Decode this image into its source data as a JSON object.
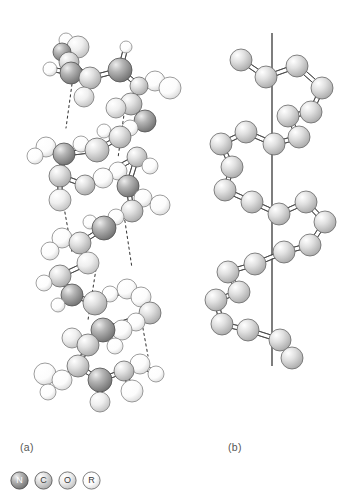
{
  "figure": {
    "type": "molecular-structure-diagram",
    "background": "#ffffff",
    "panels": [
      {
        "id": "a",
        "label": "(a)",
        "description": "ball-and-stick alpha-helix with hydrogen bonds"
      },
      {
        "id": "b",
        "label": "(b)",
        "description": "simplified backbone helix with vertical helix axis"
      }
    ]
  },
  "legend": {
    "items": [
      {
        "symbol": "N",
        "name": "nitrogen",
        "fill": "#8e8e8e",
        "stroke": "#4a4a4a",
        "label_color": "light"
      },
      {
        "symbol": "C",
        "name": "carbon",
        "fill": "#d2d2d2",
        "stroke": "#5a5a5a",
        "label_color": "dark"
      },
      {
        "symbol": "O",
        "name": "oxygen",
        "fill": "#e8e8e8",
        "stroke": "#6a6a6a",
        "label_color": "dark"
      },
      {
        "symbol": "R",
        "name": "side-chain",
        "fill": "#fbfbfb",
        "stroke": "#707070",
        "label_color": "dark"
      }
    ]
  },
  "colors": {
    "nitrogen": "#8e8e8e",
    "carbon": "#d2d2d2",
    "oxygen": "#e8e8e8",
    "hydrogen": "#fdfdfd",
    "bond_stroke": "#4a4a4a",
    "hbond_stroke": "#3a3a3a",
    "axis_stroke": "#1f1f1f",
    "text": "#555555"
  },
  "chart_data": {
    "type": "scatter",
    "title": "",
    "xlabel": "",
    "ylabel": "",
    "panel_a": {
      "atoms": [
        {
          "x": 78,
          "y": 47,
          "r": 11,
          "t": "O"
        },
        {
          "x": 66,
          "y": 40,
          "r": 7,
          "t": "H"
        },
        {
          "x": 69,
          "y": 62,
          "r": 10,
          "t": "C"
        },
        {
          "x": 62,
          "y": 52,
          "r": 9,
          "t": "N"
        },
        {
          "x": 71,
          "y": 73,
          "r": 11,
          "t": "N"
        },
        {
          "x": 50,
          "y": 69,
          "r": 7,
          "t": "H"
        },
        {
          "x": 90,
          "y": 78,
          "r": 11,
          "t": "C"
        },
        {
          "x": 84,
          "y": 97,
          "r": 10,
          "t": "O"
        },
        {
          "x": 120,
          "y": 70,
          "r": 12,
          "t": "N"
        },
        {
          "x": 126,
          "y": 47,
          "r": 6,
          "t": "H"
        },
        {
          "x": 139,
          "y": 86,
          "r": 9,
          "t": "C"
        },
        {
          "x": 155,
          "y": 81,
          "r": 10,
          "t": "R"
        },
        {
          "x": 170,
          "y": 88,
          "r": 11,
          "t": "R"
        },
        {
          "x": 131,
          "y": 104,
          "r": 11,
          "t": "C"
        },
        {
          "x": 116,
          "y": 108,
          "r": 10,
          "t": "O"
        },
        {
          "x": 145,
          "y": 121,
          "r": 11,
          "t": "N"
        },
        {
          "x": 130,
          "y": 128,
          "r": 8,
          "t": "H"
        },
        {
          "x": 120,
          "y": 137,
          "r": 11,
          "t": "C"
        },
        {
          "x": 104,
          "y": 131,
          "r": 7,
          "t": "H"
        },
        {
          "x": 97,
          "y": 150,
          "r": 12,
          "t": "C"
        },
        {
          "x": 81,
          "y": 144,
          "r": 8,
          "t": "H"
        },
        {
          "x": 64,
          "y": 154,
          "r": 11,
          "t": "N"
        },
        {
          "x": 46,
          "y": 147,
          "r": 10,
          "t": "R"
        },
        {
          "x": 35,
          "y": 156,
          "r": 8,
          "t": "H"
        },
        {
          "x": 60,
          "y": 176,
          "r": 11,
          "t": "C"
        },
        {
          "x": 60,
          "y": 200,
          "r": 11,
          "t": "O"
        },
        {
          "x": 85,
          "y": 185,
          "r": 10,
          "t": "C"
        },
        {
          "x": 103,
          "y": 178,
          "r": 10,
          "t": "R"
        },
        {
          "x": 118,
          "y": 171,
          "r": 9,
          "t": "R"
        },
        {
          "x": 137,
          "y": 157,
          "r": 10,
          "t": "C"
        },
        {
          "x": 150,
          "y": 166,
          "r": 8,
          "t": "H"
        },
        {
          "x": 128,
          "y": 186,
          "r": 11,
          "t": "N"
        },
        {
          "x": 143,
          "y": 198,
          "r": 9,
          "t": "R"
        },
        {
          "x": 160,
          "y": 205,
          "r": 10,
          "t": "R"
        },
        {
          "x": 132,
          "y": 211,
          "r": 11,
          "t": "C"
        },
        {
          "x": 116,
          "y": 217,
          "r": 8,
          "t": "H"
        },
        {
          "x": 104,
          "y": 228,
          "r": 12,
          "t": "N"
        },
        {
          "x": 90,
          "y": 222,
          "r": 7,
          "t": "H"
        },
        {
          "x": 80,
          "y": 243,
          "r": 11,
          "t": "C"
        },
        {
          "x": 62,
          "y": 238,
          "r": 10,
          "t": "R"
        },
        {
          "x": 50,
          "y": 251,
          "r": 9,
          "t": "R"
        },
        {
          "x": 88,
          "y": 263,
          "r": 11,
          "t": "O"
        },
        {
          "x": 60,
          "y": 276,
          "r": 11,
          "t": "C"
        },
        {
          "x": 44,
          "y": 283,
          "r": 8,
          "t": "H"
        },
        {
          "x": 72,
          "y": 295,
          "r": 11,
          "t": "N"
        },
        {
          "x": 58,
          "y": 305,
          "r": 7,
          "t": "H"
        },
        {
          "x": 95,
          "y": 303,
          "r": 12,
          "t": "C"
        },
        {
          "x": 110,
          "y": 294,
          "r": 8,
          "t": "H"
        },
        {
          "x": 127,
          "y": 289,
          "r": 10,
          "t": "R"
        },
        {
          "x": 141,
          "y": 297,
          "r": 10,
          "t": "R"
        },
        {
          "x": 150,
          "y": 313,
          "r": 11,
          "t": "C"
        },
        {
          "x": 136,
          "y": 322,
          "r": 9,
          "t": "R"
        },
        {
          "x": 122,
          "y": 330,
          "r": 10,
          "t": "R"
        },
        {
          "x": 103,
          "y": 330,
          "r": 12,
          "t": "N"
        },
        {
          "x": 115,
          "y": 346,
          "r": 8,
          "t": "H"
        },
        {
          "x": 88,
          "y": 345,
          "r": 11,
          "t": "C"
        },
        {
          "x": 72,
          "y": 338,
          "r": 10,
          "t": "O"
        },
        {
          "x": 78,
          "y": 366,
          "r": 11,
          "t": "C"
        },
        {
          "x": 62,
          "y": 380,
          "r": 10,
          "t": "R"
        },
        {
          "x": 45,
          "y": 374,
          "r": 11,
          "t": "R"
        },
        {
          "x": 48,
          "y": 392,
          "r": 8,
          "t": "H"
        },
        {
          "x": 100,
          "y": 380,
          "r": 12,
          "t": "N"
        },
        {
          "x": 100,
          "y": 402,
          "r": 10,
          "t": "O"
        },
        {
          "x": 124,
          "y": 371,
          "r": 10,
          "t": "C"
        },
        {
          "x": 140,
          "y": 364,
          "r": 10,
          "t": "R"
        },
        {
          "x": 156,
          "y": 374,
          "r": 8,
          "t": "H"
        },
        {
          "x": 132,
          "y": 391,
          "r": 11,
          "t": "R"
        }
      ],
      "bonds": [
        [
          0,
          2
        ],
        [
          1,
          3
        ],
        [
          2,
          3
        ],
        [
          2,
          4
        ],
        [
          4,
          5
        ],
        [
          2,
          6
        ],
        [
          6,
          7
        ],
        [
          6,
          8
        ],
        [
          8,
          9
        ],
        [
          8,
          10
        ],
        [
          10,
          11
        ],
        [
          11,
          12
        ],
        [
          10,
          13
        ],
        [
          13,
          14
        ],
        [
          13,
          15
        ],
        [
          15,
          16
        ],
        [
          15,
          17
        ],
        [
          17,
          18
        ],
        [
          17,
          19
        ],
        [
          19,
          20
        ],
        [
          19,
          21
        ],
        [
          21,
          22
        ],
        [
          22,
          23
        ],
        [
          21,
          24
        ],
        [
          24,
          25
        ],
        [
          24,
          26
        ],
        [
          26,
          27
        ],
        [
          27,
          28
        ],
        [
          26,
          29
        ],
        [
          29,
          30
        ],
        [
          29,
          31
        ],
        [
          31,
          32
        ],
        [
          32,
          33
        ],
        [
          31,
          34
        ],
        [
          34,
          35
        ],
        [
          34,
          36
        ],
        [
          36,
          37
        ],
        [
          36,
          38
        ],
        [
          38,
          39
        ],
        [
          39,
          40
        ],
        [
          38,
          41
        ],
        [
          41,
          42
        ],
        [
          42,
          43
        ],
        [
          42,
          44
        ],
        [
          44,
          45
        ],
        [
          44,
          46
        ],
        [
          46,
          47
        ],
        [
          46,
          48
        ],
        [
          48,
          49
        ],
        [
          48,
          50
        ],
        [
          50,
          51
        ],
        [
          51,
          52
        ],
        [
          50,
          53
        ],
        [
          53,
          54
        ],
        [
          53,
          55
        ],
        [
          55,
          56
        ],
        [
          55,
          57
        ],
        [
          57,
          58
        ],
        [
          58,
          59
        ],
        [
          59,
          60
        ],
        [
          57,
          61
        ],
        [
          61,
          62
        ],
        [
          61,
          63
        ],
        [
          63,
          64
        ],
        [
          64,
          65
        ],
        [
          63,
          66
        ]
      ],
      "hydrogen_bonds": [
        [
          [
            72,
            84
          ],
          [
            66,
            128
          ]
        ],
        [
          [
            126,
            100
          ],
          [
            118,
            158
          ]
        ],
        [
          [
            62,
            196
          ],
          [
            72,
            252
          ]
        ],
        [
          [
            124,
            215
          ],
          [
            132,
            268
          ]
        ],
        [
          [
            96,
            269
          ],
          [
            88,
            320
          ]
        ],
        [
          [
            140,
            312
          ],
          [
            148,
            356
          ]
        ]
      ]
    },
    "panel_b": {
      "axis": {
        "x": 272,
        "y1": 33,
        "y2": 366
      },
      "atoms": [
        {
          "x": 241,
          "y": 60,
          "r": 11
        },
        {
          "x": 266,
          "y": 77,
          "r": 11
        },
        {
          "x": 297,
          "y": 66,
          "r": 11
        },
        {
          "x": 322,
          "y": 88,
          "r": 11
        },
        {
          "x": 311,
          "y": 112,
          "r": 11
        },
        {
          "x": 288,
          "y": 116,
          "r": 11
        },
        {
          "x": 299,
          "y": 137,
          "r": 11
        },
        {
          "x": 274,
          "y": 144,
          "r": 11
        },
        {
          "x": 246,
          "y": 132,
          "r": 11
        },
        {
          "x": 221,
          "y": 144,
          "r": 11
        },
        {
          "x": 232,
          "y": 167,
          "r": 11
        },
        {
          "x": 225,
          "y": 190,
          "r": 11
        },
        {
          "x": 252,
          "y": 202,
          "r": 11
        },
        {
          "x": 279,
          "y": 214,
          "r": 11
        },
        {
          "x": 306,
          "y": 202,
          "r": 11
        },
        {
          "x": 325,
          "y": 222,
          "r": 11
        },
        {
          "x": 310,
          "y": 245,
          "r": 11
        },
        {
          "x": 284,
          "y": 252,
          "r": 11
        },
        {
          "x": 255,
          "y": 264,
          "r": 11
        },
        {
          "x": 228,
          "y": 272,
          "r": 11
        },
        {
          "x": 239,
          "y": 292,
          "r": 11
        },
        {
          "x": 216,
          "y": 300,
          "r": 11
        },
        {
          "x": 222,
          "y": 324,
          "r": 11
        },
        {
          "x": 248,
          "y": 330,
          "r": 11
        },
        {
          "x": 280,
          "y": 340,
          "r": 11
        },
        {
          "x": 292,
          "y": 358,
          "r": 11
        }
      ],
      "bonds": [
        [
          0,
          1
        ],
        [
          1,
          2
        ],
        [
          2,
          3
        ],
        [
          3,
          4
        ],
        [
          4,
          5
        ],
        [
          5,
          6
        ],
        [
          6,
          7
        ],
        [
          7,
          8
        ],
        [
          8,
          9
        ],
        [
          9,
          10
        ],
        [
          10,
          11
        ],
        [
          11,
          12
        ],
        [
          12,
          13
        ],
        [
          13,
          14
        ],
        [
          14,
          15
        ],
        [
          15,
          16
        ],
        [
          16,
          17
        ],
        [
          17,
          18
        ],
        [
          18,
          19
        ],
        [
          19,
          20
        ],
        [
          20,
          21
        ],
        [
          21,
          22
        ],
        [
          22,
          23
        ],
        [
          23,
          24
        ],
        [
          24,
          25
        ]
      ]
    }
  }
}
